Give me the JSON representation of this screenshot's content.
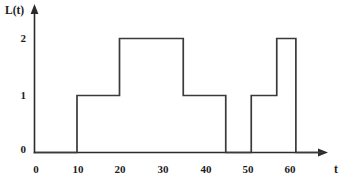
{
  "chart_data": {
    "type": "line",
    "subtype": "step-function",
    "title": "",
    "xlabel": "t",
    "ylabel": "L(t)",
    "xlim": [
      0,
      68
    ],
    "ylim": [
      0,
      2.4
    ],
    "grid": false,
    "legend": null,
    "x_ticks": [
      0,
      10,
      20,
      30,
      40,
      50,
      60
    ],
    "x_tick_labels": [
      "0",
      "10",
      "20",
      "30",
      "40",
      "50",
      "60"
    ],
    "y_ticks": [
      0,
      1,
      2
    ],
    "y_tick_labels": [
      "0",
      "1",
      "2"
    ],
    "line_color": "#3a3a3a",
    "axis_color": "#2b2b2b",
    "background_color": "#ffffff",
    "steps": [
      {
        "t_start": 0,
        "t_end": 10,
        "value": 0
      },
      {
        "t_start": 10,
        "t_end": 20,
        "value": 1
      },
      {
        "t_start": 20,
        "t_end": 35,
        "value": 2
      },
      {
        "t_start": 35,
        "t_end": 45,
        "value": 1
      },
      {
        "t_start": 45,
        "t_end": 51,
        "value": 0
      },
      {
        "t_start": 51,
        "t_end": 57,
        "value": 1
      },
      {
        "t_start": 57,
        "t_end": 61.5,
        "value": 2
      },
      {
        "t_start": 61.5,
        "t_end": 68,
        "value": 0
      }
    ],
    "x": [
      0,
      10,
      10,
      20,
      20,
      35,
      35,
      45,
      45,
      51,
      51,
      57,
      57,
      61.5,
      61.5,
      68
    ],
    "y": [
      0,
      0,
      1,
      1,
      2,
      2,
      1,
      1,
      0,
      0,
      1,
      1,
      2,
      2,
      0,
      0
    ]
  },
  "axes": {
    "y_axis_label": "L(t)",
    "x_axis_label": "t",
    "y_labels": [
      "2",
      "1",
      "0"
    ],
    "x_labels": [
      "0",
      "10",
      "20",
      "30",
      "40",
      "50",
      "60"
    ]
  }
}
